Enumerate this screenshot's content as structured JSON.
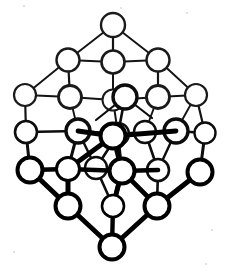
{
  "figure": {
    "background_color": "#ffffff",
    "ink_color": "#000000",
    "canvas": {
      "width": 229,
      "height": 271
    }
  },
  "style": {
    "atom_fill": "#ffffff",
    "atom_stroke": "#000000",
    "bond_color": "#000000",
    "front_bond_width": 5.0,
    "mid_bond_width": 3.2,
    "back_bond_width": 1.8,
    "front_atom_radius": 11.5,
    "mid_atom_radius": 10.5,
    "back_atom_radius": 10.0,
    "front_atom_stroke_width": 3.6,
    "mid_atom_stroke_width": 2.6,
    "back_atom_stroke_width": 2.0
  },
  "lattice": {
    "layer_count": 3,
    "atoms_per_layer": 9,
    "grid": "3 x 3 x 3",
    "total_atoms": 27,
    "projection": "body-diagonal / rhombic isometric",
    "origin": {
      "x": 113.0,
      "y": 136.0
    },
    "basis": {
      "a": {
        "dx": 42.0,
        "dy": -24.0
      },
      "b": {
        "dx": -42.0,
        "dy": -24.0
      },
      "c": {
        "dx": 0.0,
        "dy": 37.0
      }
    },
    "index_range": [
      -1,
      0,
      1
    ]
  },
  "layers": [
    {
      "name": "back-layer",
      "depth": -1,
      "class": "back",
      "label": "rear plane"
    },
    {
      "name": "middle-layer",
      "depth": 0,
      "class": "mid",
      "label": "middle plane"
    },
    {
      "name": "front-layer",
      "depth": 1,
      "class": "front",
      "label": "front plane"
    }
  ],
  "nodes": [
    {
      "id": "n-b-0",
      "layer": "back",
      "cx": 113,
      "cy": 25
    },
    {
      "id": "n-b-1",
      "layer": "back",
      "cx": 68,
      "cy": 60
    },
    {
      "id": "n-b-2",
      "layer": "back",
      "cx": 158,
      "cy": 60
    },
    {
      "id": "n-b-3",
      "layer": "back",
      "cx": 25,
      "cy": 95
    },
    {
      "id": "n-b-4",
      "layer": "back",
      "cx": 113,
      "cy": 62
    },
    {
      "id": "n-b-5",
      "layer": "back",
      "cx": 196,
      "cy": 95
    },
    {
      "id": "n-b-6",
      "layer": "back",
      "cx": 70,
      "cy": 97
    },
    {
      "id": "n-b-7",
      "layer": "back",
      "cx": 158,
      "cy": 97
    },
    {
      "id": "n-b-8",
      "layer": "back",
      "cx": 113,
      "cy": 100
    },
    {
      "id": "n-m-0",
      "layer": "mid",
      "cx": 125,
      "cy": 97
    },
    {
      "id": "n-m-1",
      "layer": "mid",
      "cx": 26,
      "cy": 132
    },
    {
      "id": "n-m-2",
      "layer": "mid",
      "cx": 78,
      "cy": 131
    },
    {
      "id": "n-m-3",
      "layer": "mid",
      "cx": 118,
      "cy": 134
    },
    {
      "id": "n-m-4",
      "layer": "mid",
      "cx": 145,
      "cy": 132
    },
    {
      "id": "n-m-5",
      "layer": "mid",
      "cx": 176,
      "cy": 131
    },
    {
      "id": "n-m-6",
      "layer": "mid",
      "cx": 205,
      "cy": 133
    },
    {
      "id": "n-m-7",
      "layer": "mid",
      "cx": 96,
      "cy": 168
    },
    {
      "id": "n-m-8",
      "layer": "mid",
      "cx": 158,
      "cy": 170
    },
    {
      "id": "n-f-0",
      "layer": "front",
      "cx": 30,
      "cy": 170
    },
    {
      "id": "n-f-1",
      "layer": "front",
      "cx": 68,
      "cy": 169
    },
    {
      "id": "n-f-2",
      "layer": "front",
      "cx": 122,
      "cy": 171
    },
    {
      "id": "n-f-3",
      "layer": "front",
      "cx": 200,
      "cy": 172
    },
    {
      "id": "n-f-4",
      "layer": "front",
      "cx": 68,
      "cy": 206
    },
    {
      "id": "n-f-5",
      "layer": "front",
      "cx": 113,
      "cy": 206
    },
    {
      "id": "n-f-6",
      "layer": "front",
      "cx": 157,
      "cy": 206
    },
    {
      "id": "n-f-7",
      "layer": "front",
      "cx": 112,
      "cy": 247
    },
    {
      "id": "n-f-8",
      "layer": "front",
      "cx": 113,
      "cy": 136
    }
  ],
  "bond_count": {
    "front": 16,
    "mid": 18,
    "back": 20
  }
}
